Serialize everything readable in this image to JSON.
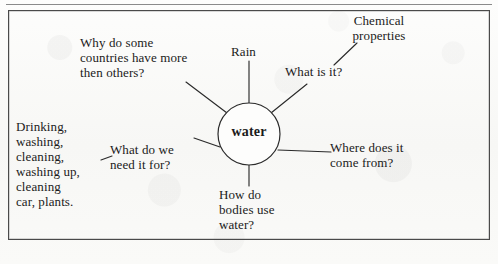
{
  "document": {
    "type": "mind-map",
    "title": "water",
    "border_color": "#4a4a4a",
    "ink_color": "#1b1b1b",
    "paper_color": "#fbfbfa"
  },
  "center": {
    "label": "water"
  },
  "branches": [
    {
      "id": "why-countries",
      "label": "Why do some\ncountries have more\nthen others?"
    },
    {
      "id": "rain",
      "label": "Rain"
    },
    {
      "id": "what-is-it",
      "label": "What is it?"
    },
    {
      "id": "where-from",
      "label": "Where does it\ncome from?"
    },
    {
      "id": "how-bodies-use",
      "label": "How do\nbodies use\nwater?"
    },
    {
      "id": "need-it-for",
      "label": "What do we\nneed it for?"
    }
  ],
  "sub_branches": [
    {
      "id": "chemical-properties",
      "parent": "what-is-it",
      "label": "Chemical\nproperties"
    },
    {
      "id": "uses-list",
      "parent": "need-it-for",
      "label": "Drinking,\nwashing,\ncleaning,\nwashing up,\ncleaning\ncar, plants."
    }
  ]
}
